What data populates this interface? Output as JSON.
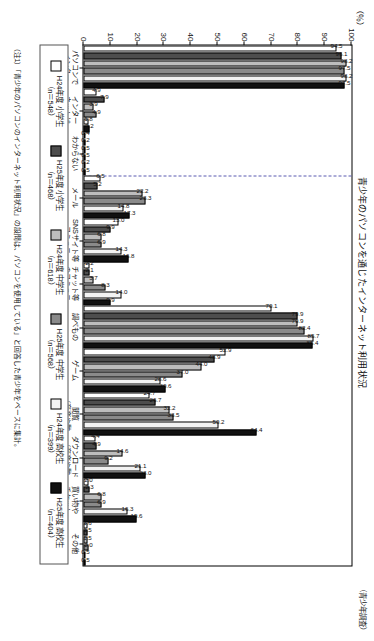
{
  "figure": {
    "title": "青少年のパソコンを通じたインターネット利用状況",
    "note_right": "（青少年調査）",
    "footnote": "（注1）「青少年のパソコンのインターネット利用状況」の設問は、パソコンを使用している」と回答した青少年をベースに集計。",
    "percent_label": "（％）"
  },
  "colors": {
    "h24_shougakusei": "#ffffff",
    "h25_shougakusei": "#4d4d4d",
    "h24_chuugakusei": "#bdbdbd",
    "h25_chuugakusei": "#8a8a8a",
    "h24_koukousei": "#f2f2f2",
    "h25_koukousei": "#111111",
    "axis": "#000000",
    "divider": "#5a5ab0"
  },
  "legend": {
    "position": "below-plot",
    "items": [
      {
        "label": "H24年度 小学生",
        "n": "（n＝548）",
        "swatch": "#ffffff"
      },
      {
        "label": "H25年度 小学生",
        "n": "（n＝468）",
        "swatch": "#4d4d4d"
      },
      {
        "label": "H24年度 中学生",
        "n": "（n＝618）",
        "swatch": "#bdbdbd"
      },
      {
        "label": "H25年度 中学生",
        "n": "（n＝568）",
        "swatch": "#8a8a8a"
      },
      {
        "label": "H24年度 高校生",
        "n": "（n＝399）",
        "swatch": "#f2f2f2"
      },
      {
        "label": "H25年度 高校生",
        "n": "（n＝404）",
        "swatch": "#111111"
      }
    ]
  },
  "chart_data": {
    "type": "bar",
    "title": "青少年のパソコンを通じたインターネット利用状況",
    "xlabel": "",
    "ylabel": "（％）",
    "ylim": [
      0,
      100
    ],
    "yticks": [
      0,
      10,
      20,
      30,
      40,
      50,
      60,
      70,
      80,
      90,
      100
    ],
    "grid": false,
    "legend_position": "below",
    "categories": [
      "パソコンで\nインター\nネット\n（計）",
      "インター\nネットは\n使って\nいない",
      "わからない",
      "メール",
      "SNSサイト等\nコミュニ\nケーション",
      "チャット等\nのコミュニ\nケーション",
      "調べもの",
      "ゲーム",
      "閲覧\n（音楽や動\n画等の）",
      "ダウンロード\n（音楽や動\n画等の）",
      "買い物や\nチケット\nの予約",
      "その他"
    ],
    "series": [
      {
        "name": "H24年度 小学生",
        "values": [
          94.5,
          4.9,
          0.4,
          6.5,
          13.0,
          2.2,
          70.1,
          52.9,
          24.7,
          4.4,
          2.0,
          1.6
        ]
      },
      {
        "name": "H25年度 小学生",
        "values": [
          96.1,
          7.9,
          0.2,
          5.2,
          9.9,
          2.1,
          79.9,
          48.9,
          26.7,
          4.9,
          2.3,
          1.5
        ]
      },
      {
        "name": "H24年度 中学生",
        "values": [
          98.2,
          3.9,
          0.5,
          22.2,
          6.8,
          3.7,
          79.9,
          44.0,
          32.2,
          14.6,
          6.8,
          1.5
        ]
      },
      {
        "name": "H25年度 中学生",
        "values": [
          97.5,
          4.9,
          0.5,
          23.3,
          6.9,
          8.3,
          82.4,
          37.0,
          33.5,
          9.2,
          6.9,
          2.0
        ]
      },
      {
        "name": "H24年度 高校生",
        "values": [
          98.2,
          1.8,
          0.2,
          14.8,
          14.3,
          14.0,
          85.7,
          28.6,
          50.2,
          21.1,
          16.3,
          0.5
        ]
      },
      {
        "name": "H25年度 高校生",
        "values": [
          97.5,
          2.2,
          0.5,
          17.3,
          16.8,
          9.9,
          85.4,
          30.6,
          64.4,
          23.0,
          19.6,
          0.5
        ]
      }
    ],
    "value_labels": {
      "パソコンで\nインター\nネット\n（計）": [
        "94.5",
        "96.1",
        "98.2",
        "97.5",
        "98.2",
        "97.5"
      ],
      "インター\nネットは\n使って\nいない": [
        "4.9",
        "7.9",
        "3.9",
        "4.9",
        "1.8",
        "2.2"
      ],
      "わからない": [
        "0.4",
        "0.2",
        "0.5",
        "0.5",
        "0.2",
        "0.5"
      ],
      "メール": [
        "6.5",
        "5.2",
        "22.2",
        "23.3",
        "14.8",
        "17.3"
      ],
      "SNSサイト等\nコミュニ\nケーション": [
        "13.0",
        "9.9",
        "6.8",
        "6.9",
        "14.3",
        "16.8"
      ],
      "チャット等\nのコミュニ\nケーション": [
        "2.2",
        "2.1",
        "3.7",
        "8.3",
        "14.0",
        "9.9"
      ],
      "調べもの": [
        "70.1",
        "79.9",
        "79.9",
        "82.4",
        "85.7",
        "85.4"
      ],
      "ゲーム": [
        "52.9",
        "48.9",
        "44.0",
        "37.0",
        "28.6",
        "30.6"
      ],
      "閲覧\n（音楽や動\n画等の）": [
        "24.7",
        "26.7",
        "32.2",
        "33.5",
        "50.2",
        "64.4"
      ],
      "ダウンロード\n（音楽や動\n画等の）": [
        "4.4",
        "4.9",
        "14.6",
        "9.2",
        "21.1",
        "23.0"
      ],
      "買い物や\nチケット\nの予約": [
        "2.0",
        "2.3",
        "6.8",
        "6.9",
        "16.3",
        "19.6"
      ],
      "その他": [
        "1.6",
        "1.5",
        "1.5",
        "2.0",
        "0.5",
        "0.5"
      ]
    }
  }
}
